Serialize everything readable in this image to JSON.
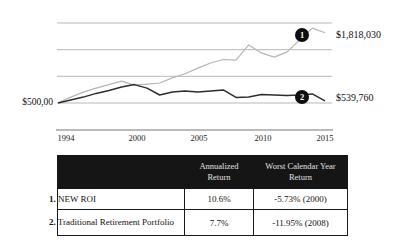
{
  "chart_data": {
    "type": "line",
    "title": "",
    "xlabel": "",
    "ylabel": "",
    "grid": true,
    "legend": "none",
    "x": [
      1994,
      1995,
      1996,
      1997,
      1998,
      1999,
      2000,
      2001,
      2002,
      2003,
      2004,
      2005,
      2006,
      2007,
      2008,
      2009,
      2010,
      2011,
      2012,
      2013,
      2014,
      2015
    ],
    "x_tick_labels": [
      "1994",
      "2000",
      "2005",
      "2010",
      "2015"
    ],
    "ylim": [
      500000,
      2000000
    ],
    "gridline_values": [
      500000,
      1000000,
      1500000,
      2000000
    ],
    "start_value_label": "$500,00",
    "series": [
      {
        "name": "NEW ROI",
        "marker": "1",
        "color": "#b5b5b5",
        "width": 1.2,
        "end_value": 1818030,
        "end_value_label": "$1,818,030",
        "values": [
          500000,
          610000,
          705000,
          780000,
          845000,
          910000,
          835000,
          855000,
          875000,
          970000,
          1050000,
          1155000,
          1250000,
          1315000,
          1305000,
          1590000,
          1440000,
          1360000,
          1455000,
          1680000,
          1905000,
          1818030
        ]
      },
      {
        "name": "Traditional Retirement Portfolio",
        "marker": "2",
        "color": "#2e2e2e",
        "width": 1.5,
        "end_value": 539760,
        "end_value_label": "$539,760",
        "values": [
          500000,
          555000,
          610000,
          680000,
          735000,
          800000,
          845000,
          780000,
          650000,
          705000,
          725000,
          705000,
          725000,
          745000,
          605000,
          610000,
          660000,
          650000,
          640000,
          650000,
          670000,
          539760
        ]
      }
    ]
  },
  "table": {
    "headers": [
      "",
      "Annualized Return",
      "Worst Calendar Year Return"
    ],
    "rows": [
      {
        "num": "1.",
        "name": "NEW ROI",
        "annualized": "10.6%",
        "worst": "-5.73% (2000)"
      },
      {
        "num": "2.",
        "name": "Traditional Retirement Portfolio",
        "annualized": "7.7%",
        "worst": "-11.95% (2008)"
      }
    ]
  },
  "colors": {
    "header_bg": "#151515",
    "header_text": "#e2e2e2",
    "gridline": "#999999",
    "axis": "#666666",
    "series1": "#b5b5b5",
    "series2": "#2e2e2e",
    "badge_bg": "#0d0d0d"
  }
}
